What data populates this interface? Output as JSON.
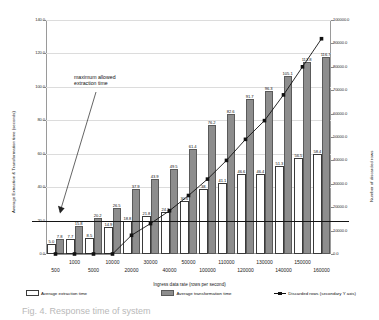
{
  "chart_data": {
    "type": "bar",
    "title": "",
    "xlabel": "Ingress data rate (rows per second)",
    "ylabel": "Average Extraction & Transformation time (seconds)",
    "y2label": "Number of discarded rows",
    "ylim": [
      0.0,
      140.0
    ],
    "ystep": 20.0,
    "y2lim": [
      0.0,
      100000.0
    ],
    "y2step": 10000.0,
    "grid": true,
    "legend_position": "bottom",
    "categories": [
      "500",
      "1000",
      "5000",
      "10000",
      "20000",
      "30000",
      "40000",
      "50000",
      "100000",
      "110000",
      "120000",
      "130000",
      "140000",
      "150000",
      "160000"
    ],
    "ytick_labels": [
      "0.0",
      "20.0",
      "40.0",
      "60.0",
      "80.0",
      "100.0",
      "120.0",
      "140.0"
    ],
    "y2tick_labels": [
      "0.0",
      "10000.0",
      "20000.0",
      "30000.0",
      "40000.0",
      "50000.0",
      "60000.0",
      "70000.0",
      "80000.0",
      "90000.0",
      "100000.0"
    ],
    "series": [
      {
        "name": "Average extraction time",
        "kind": "bar",
        "color": "#ffffff",
        "values": [
          5.0,
          7.7,
          8.5,
          14.9,
          18.8,
          21.8,
          24.2,
          30.6,
          38.0,
          41.1,
          46.6,
          46.4,
          51.3,
          56.5,
          58.4
        ],
        "labels": [
          "5.0",
          "7.7",
          "8.5",
          "14.9",
          "18.8",
          "21.8",
          "24.2",
          "30.6",
          "38",
          "41.1",
          "46.6",
          "46.4",
          "51.3",
          "56.5",
          "58.4"
        ]
      },
      {
        "name": "Average transformation time",
        "kind": "bar",
        "color": "#8d8d8d",
        "values": [
          7.8,
          15.8,
          20.2,
          26.5,
          37.9,
          43.9,
          49.5,
          61.4,
          76.2,
          82.6,
          91.7,
          96.3,
          105.1,
          113.8,
          116.7
        ],
        "labels": [
          "7.8",
          "15.8",
          "20.2",
          "26.5",
          "37.9",
          "43.9",
          "49.5",
          "61.4",
          "76.2",
          "82.6",
          "91.7",
          "96.3",
          "105.1",
          "113.8",
          "116.7"
        ]
      },
      {
        "name": "Discarded rows (secondary Y axis)",
        "kind": "line",
        "axis": "secondary",
        "color": "#111111",
        "values": [
          0,
          0,
          0,
          0,
          8000,
          13000,
          18500,
          25000,
          32000,
          40000,
          49000,
          57000,
          68000,
          80000,
          92000
        ]
      }
    ],
    "annotations": [
      {
        "name": "maximum-allowed-extraction-time",
        "text": "maximum allowed\nextraction time",
        "threshold_value": 20.0
      }
    ]
  },
  "legend": {
    "items": [
      {
        "label": "Average extraction time",
        "swatch": "extract-swatch"
      },
      {
        "label": "Average transformation time",
        "swatch": "transform-swatch"
      },
      {
        "label": "Discarded rows (secondary Y axis)",
        "swatch": "line-marker-swatch"
      }
    ]
  },
  "caption": {
    "text": "Fig. 4. Response time of system"
  }
}
